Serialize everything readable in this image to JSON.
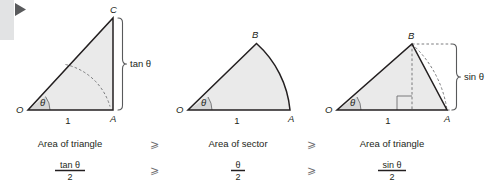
{
  "figure": {
    "background_color": "#ffffff",
    "shape_fill_color": "#eaeaea",
    "stroke_color": "#231f20",
    "dash_color": "#6d6e71",
    "inequality_color": "#6d6e71"
  },
  "decoration": {
    "sidebar_block_name": "gray-block",
    "play_marker_name": "play-triangle-marker"
  },
  "panels": [
    {
      "id": "panel-tangent",
      "shape": "right-triangle",
      "vertices": {
        "origin": "O",
        "base_end": "A",
        "apex": "C"
      },
      "base_length_label": "1",
      "angle_label": "θ",
      "measure_label": "tan θ",
      "caption": "Area of triangle",
      "formula_numerator": "tan θ",
      "formula_denominator": "2"
    },
    {
      "id": "panel-sector",
      "shape": "circular-sector",
      "vertices": {
        "origin": "O",
        "base_end": "A",
        "apex": "B"
      },
      "base_length_label": "1",
      "angle_label": "θ",
      "measure_label": "",
      "caption": "Area of sector",
      "formula_numerator": "θ",
      "formula_denominator": "2"
    },
    {
      "id": "panel-sine",
      "shape": "triangle-with-height",
      "vertices": {
        "origin": "O",
        "base_end": "A",
        "apex": "B"
      },
      "base_length_label": "1",
      "angle_label": "θ",
      "measure_label": "sin θ",
      "caption": "Area of triangle",
      "formula_numerator": "sin θ",
      "formula_denominator": "2"
    }
  ],
  "inequalities": {
    "symbol": "⩾",
    "caption_row": [
      "⩾",
      "⩾"
    ],
    "formula_row": [
      "⩾",
      "⩾"
    ]
  }
}
